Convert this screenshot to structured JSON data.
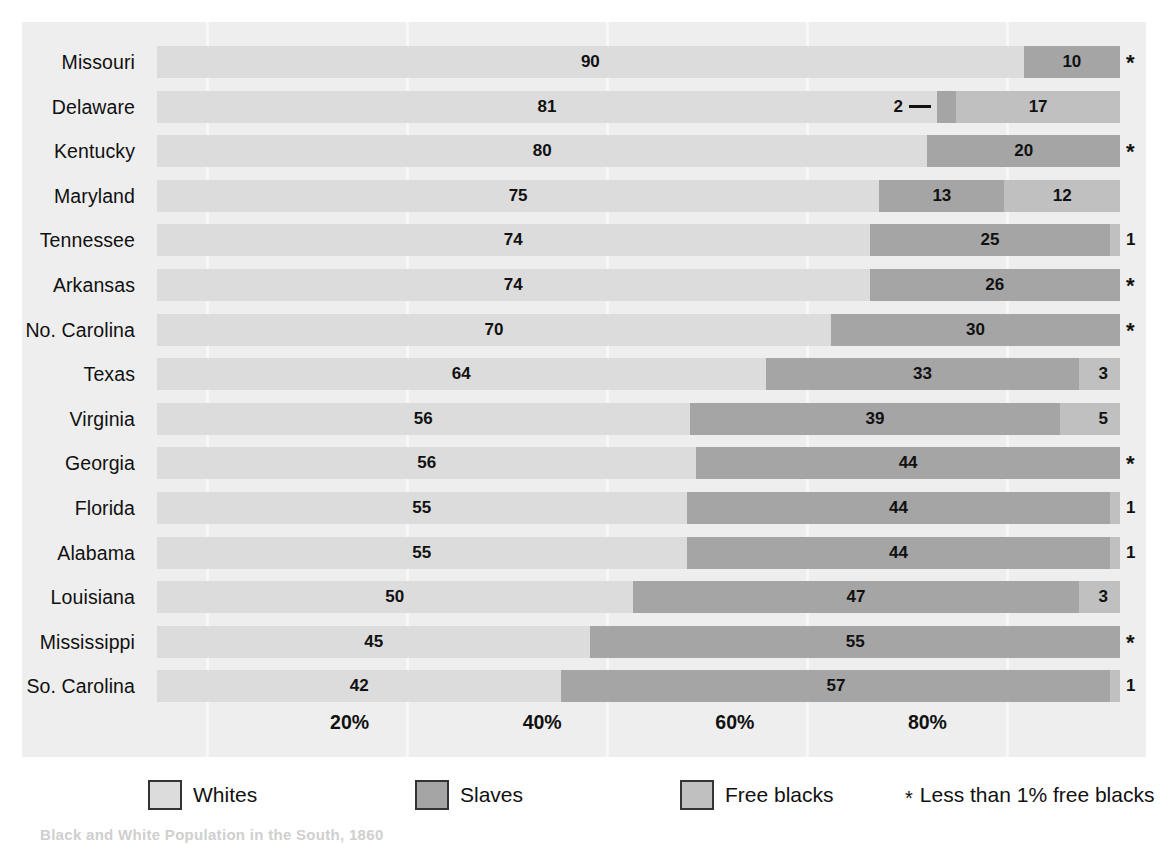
{
  "chart_data": {
    "type": "bar",
    "subtype": "100% stacked horizontal bar",
    "title": "",
    "xlabel": "",
    "ylabel": "",
    "xlim": [
      0,
      100
    ],
    "grid": false,
    "legend_position": "bottom",
    "tick_labels": [
      "20%",
      "40%",
      "60%",
      "80%"
    ],
    "tick_values": [
      20,
      40,
      60,
      80
    ],
    "series": [
      {
        "name": "Whites",
        "color": "#dcdcdc",
        "values": [
          90,
          81,
          80,
          75,
          74,
          74,
          70,
          64,
          56,
          56,
          55,
          55,
          50,
          45,
          42
        ]
      },
      {
        "name": "Slaves",
        "color": "#a5a5a5",
        "values": [
          10,
          2,
          20,
          13,
          25,
          26,
          30,
          33,
          39,
          44,
          44,
          44,
          47,
          55,
          57
        ]
      },
      {
        "name": "Free blacks",
        "color": "#c0c0c0",
        "values": [
          0,
          17,
          0,
          12,
          1,
          0,
          0,
          3,
          5,
          0,
          1,
          1,
          3,
          0,
          1
        ]
      }
    ],
    "categories": [
      "Missouri",
      "Delaware",
      "Kentucky",
      "Maryland",
      "Tennessee",
      "Arkansas",
      "No. Carolina",
      "Texas",
      "Virginia",
      "Georgia",
      "Florida",
      "Alabama",
      "Louisiana",
      "Mississippi",
      "So. Carolina"
    ],
    "rows": [
      {
        "state": "Missouri",
        "segments": [
          {
            "cat": "Whites",
            "value": 90,
            "label": "90"
          },
          {
            "cat": "Slaves",
            "value": 10,
            "label": "10"
          }
        ],
        "end_marker": "*"
      },
      {
        "state": "Delaware",
        "segments": [
          {
            "cat": "Whites",
            "value": 81,
            "label": "81"
          },
          {
            "cat": "Slaves",
            "value": 2,
            "label": "2",
            "callout": true
          },
          {
            "cat": "Free blacks",
            "value": 17,
            "label": "17"
          }
        ],
        "end_marker": ""
      },
      {
        "state": "Kentucky",
        "segments": [
          {
            "cat": "Whites",
            "value": 80,
            "label": "80"
          },
          {
            "cat": "Slaves",
            "value": 20,
            "label": "20"
          }
        ],
        "end_marker": "*"
      },
      {
        "state": "Maryland",
        "segments": [
          {
            "cat": "Whites",
            "value": 75,
            "label": "75"
          },
          {
            "cat": "Slaves",
            "value": 13,
            "label": "13"
          },
          {
            "cat": "Free blacks",
            "value": 12,
            "label": "12"
          }
        ],
        "end_marker": ""
      },
      {
        "state": "Tennessee",
        "segments": [
          {
            "cat": "Whites",
            "value": 74,
            "label": "74"
          },
          {
            "cat": "Slaves",
            "value": 25,
            "label": "25"
          },
          {
            "cat": "Free blacks",
            "value": 1,
            "label": ""
          }
        ],
        "end_marker": "1"
      },
      {
        "state": "Arkansas",
        "segments": [
          {
            "cat": "Whites",
            "value": 74,
            "label": "74"
          },
          {
            "cat": "Slaves",
            "value": 26,
            "label": "26"
          }
        ],
        "end_marker": "*"
      },
      {
        "state": "No. Carolina",
        "segments": [
          {
            "cat": "Whites",
            "value": 70,
            "label": "70"
          },
          {
            "cat": "Slaves",
            "value": 30,
            "label": "30"
          }
        ],
        "end_marker": "*"
      },
      {
        "state": "Texas",
        "segments": [
          {
            "cat": "Whites",
            "value": 64,
            "label": "64"
          },
          {
            "cat": "Slaves",
            "value": 33,
            "label": "33"
          },
          {
            "cat": "Free blacks",
            "value": 3,
            "label": "3",
            "inner_right": true
          }
        ],
        "end_marker": ""
      },
      {
        "state": "Virginia",
        "segments": [
          {
            "cat": "Whites",
            "value": 56,
            "label": "56"
          },
          {
            "cat": "Slaves",
            "value": 39,
            "label": "39"
          },
          {
            "cat": "Free blacks",
            "value": 5,
            "label": "5",
            "inner_right": true
          }
        ],
        "end_marker": ""
      },
      {
        "state": "Georgia",
        "segments": [
          {
            "cat": "Whites",
            "value": 56,
            "label": "56"
          },
          {
            "cat": "Slaves",
            "value": 44,
            "label": "44"
          }
        ],
        "end_marker": "*"
      },
      {
        "state": "Florida",
        "segments": [
          {
            "cat": "Whites",
            "value": 55,
            "label": "55"
          },
          {
            "cat": "Slaves",
            "value": 44,
            "label": "44"
          },
          {
            "cat": "Free blacks",
            "value": 1,
            "label": ""
          }
        ],
        "end_marker": "1"
      },
      {
        "state": "Alabama",
        "segments": [
          {
            "cat": "Whites",
            "value": 55,
            "label": "55"
          },
          {
            "cat": "Slaves",
            "value": 44,
            "label": "44"
          },
          {
            "cat": "Free blacks",
            "value": 1,
            "label": ""
          }
        ],
        "end_marker": "1"
      },
      {
        "state": "Louisiana",
        "segments": [
          {
            "cat": "Whites",
            "value": 50,
            "label": "50"
          },
          {
            "cat": "Slaves",
            "value": 47,
            "label": "47"
          },
          {
            "cat": "Free blacks",
            "value": 3,
            "label": "3",
            "inner_right": true
          }
        ],
        "end_marker": ""
      },
      {
        "state": "Mississippi",
        "segments": [
          {
            "cat": "Whites",
            "value": 45,
            "label": "45"
          },
          {
            "cat": "Slaves",
            "value": 55,
            "label": "55"
          }
        ],
        "end_marker": "*"
      },
      {
        "state": "So. Carolina",
        "segments": [
          {
            "cat": "Whites",
            "value": 42,
            "label": "42"
          },
          {
            "cat": "Slaves",
            "value": 57,
            "label": "57"
          },
          {
            "cat": "Free blacks",
            "value": 1,
            "label": ""
          }
        ],
        "end_marker": "1"
      }
    ]
  },
  "legend": {
    "items": [
      {
        "label": "Whites",
        "color": "#dcdcdc",
        "swatch": "legend-swatch-whites"
      },
      {
        "label": "Slaves",
        "color": "#a5a5a5",
        "swatch": "legend-swatch-slaves"
      },
      {
        "label": "Free blacks",
        "color": "#c0c0c0",
        "swatch": "legend-swatch-free-blacks"
      }
    ],
    "footnote_symbol": "*",
    "footnote_text": "Less than 1% free blacks"
  },
  "caption": "Black and White Population in the South, 1860",
  "colors": {
    "panel_background": "#eeeeee",
    "page_background": "#ffffff",
    "whites": "#dcdcdc",
    "slaves": "#a5a5a5",
    "free_blacks": "#c0c0c0",
    "text": "#111111"
  }
}
